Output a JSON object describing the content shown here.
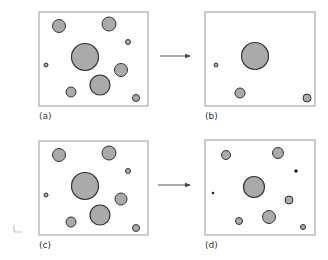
{
  "colors": {
    "box_stroke": "#9a9a9a",
    "circle_fill": "#aaaaaa",
    "circle_stroke": "#333333",
    "arrow": "#555555",
    "dot": "#222222"
  },
  "panels": [
    {
      "id": "a",
      "label": "(a)",
      "box": {
        "x": 39,
        "y": 12,
        "w": 109,
        "h": 94
      },
      "label_pos": {
        "x": 39,
        "y": 119
      },
      "circles": [
        {
          "cx": 59,
          "cy": 26,
          "r": 6.5
        },
        {
          "cx": 109,
          "cy": 24,
          "r": 7
        },
        {
          "cx": 128,
          "cy": 42,
          "r": 2.5
        },
        {
          "cx": 85,
          "cy": 57,
          "r": 13.5
        },
        {
          "cx": 46,
          "cy": 65,
          "r": 2
        },
        {
          "cx": 121,
          "cy": 70,
          "r": 6.5
        },
        {
          "cx": 100,
          "cy": 85,
          "r": 10
        },
        {
          "cx": 71,
          "cy": 92,
          "r": 5
        },
        {
          "cx": 136,
          "cy": 98,
          "r": 3.5
        }
      ]
    },
    {
      "id": "b",
      "label": "(b)",
      "box": {
        "x": 205,
        "y": 12,
        "w": 110,
        "h": 94
      },
      "label_pos": {
        "x": 205,
        "y": 119
      },
      "circles": [
        {
          "cx": 255,
          "cy": 56,
          "r": 13.5
        },
        {
          "cx": 216,
          "cy": 65,
          "r": 2
        },
        {
          "cx": 240,
          "cy": 93,
          "r": 5
        },
        {
          "cx": 307,
          "cy": 98,
          "r": 4
        }
      ]
    },
    {
      "id": "c",
      "label": "(c)",
      "box": {
        "x": 39,
        "y": 141,
        "w": 109,
        "h": 94
      },
      "label_pos": {
        "x": 39,
        "y": 248
      },
      "circles": [
        {
          "cx": 59,
          "cy": 155,
          "r": 6.5
        },
        {
          "cx": 109,
          "cy": 153,
          "r": 7
        },
        {
          "cx": 128,
          "cy": 171,
          "r": 2.5
        },
        {
          "cx": 85,
          "cy": 186,
          "r": 13.5
        },
        {
          "cx": 46,
          "cy": 195,
          "r": 2
        },
        {
          "cx": 121,
          "cy": 199,
          "r": 6
        },
        {
          "cx": 100,
          "cy": 215,
          "r": 10
        },
        {
          "cx": 71,
          "cy": 222,
          "r": 5
        },
        {
          "cx": 136,
          "cy": 228,
          "r": 3.5
        }
      ]
    },
    {
      "id": "d",
      "label": "(d)",
      "box": {
        "x": 205,
        "y": 140,
        "w": 110,
        "h": 95
      },
      "label_pos": {
        "x": 205,
        "y": 248
      },
      "circles": [
        {
          "cx": 226,
          "cy": 155,
          "r": 4.5
        },
        {
          "cx": 278,
          "cy": 153,
          "r": 5.5
        },
        {
          "cx": 296,
          "cy": 171,
          "r": 1.5,
          "dot": true
        },
        {
          "cx": 254,
          "cy": 187,
          "r": 10.5
        },
        {
          "cx": 213,
          "cy": 193,
          "r": 1,
          "dot": true
        },
        {
          "cx": 289,
          "cy": 200,
          "r": 4
        },
        {
          "cx": 269,
          "cy": 217,
          "r": 6.5
        },
        {
          "cx": 239,
          "cy": 221,
          "r": 3.5
        },
        {
          "cx": 303,
          "cy": 227,
          "r": 2.5
        }
      ]
    }
  ],
  "arrows": [
    {
      "from": "a",
      "to": "b",
      "x1": 160,
      "y1": 56,
      "x2": 190,
      "y2": 56
    },
    {
      "from": "c",
      "to": "d",
      "x1": 158,
      "y1": 185,
      "x2": 190,
      "y2": 185
    }
  ],
  "corner_mark": {
    "x": 14,
    "y": 232,
    "w": 8,
    "h": 7
  }
}
